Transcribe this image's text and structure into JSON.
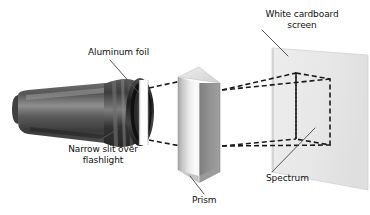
{
  "figure": {
    "background_color": "#ffffff",
    "width": 370,
    "height": 215
  },
  "labels": {
    "aluminum_foil": "Aluminum foil",
    "white_cardboard_screen_line1": "White cardboard",
    "white_cardboard_screen_line2": "screen",
    "narrow_slit_line1": "Narrow slit over",
    "narrow_slit_line2": "flashlight",
    "prism": "Prism",
    "spectrum": "Spectrum"
  },
  "objects": {
    "flashlight": {
      "name": "flashlight",
      "body_color": "#4a4a4a",
      "body_highlight_color": "#8d8d8d",
      "head_color": "#2e2e2e",
      "slit_color": "#ffffff"
    },
    "prism": {
      "name": "triangular-prism",
      "left_face_color": "#f2f2f2",
      "left_face_shadow_color": "#9a9a9a",
      "right_face_color": "#8d8d8d",
      "top_face_color": "#d8d8d8"
    },
    "screen": {
      "name": "white-cardboard-screen",
      "face_color": "#e9e9e9",
      "edge_color": "#c4c4c4"
    },
    "spectrum_region": {
      "name": "spectrum-outline",
      "style": "dashed",
      "color": "#1a1a1a"
    },
    "light_rays": {
      "name": "light-ray-paths",
      "style": "dashed",
      "color": "#1a1a1a"
    }
  },
  "leader_lines": {
    "color": "#4a4a4a",
    "width": 1
  }
}
